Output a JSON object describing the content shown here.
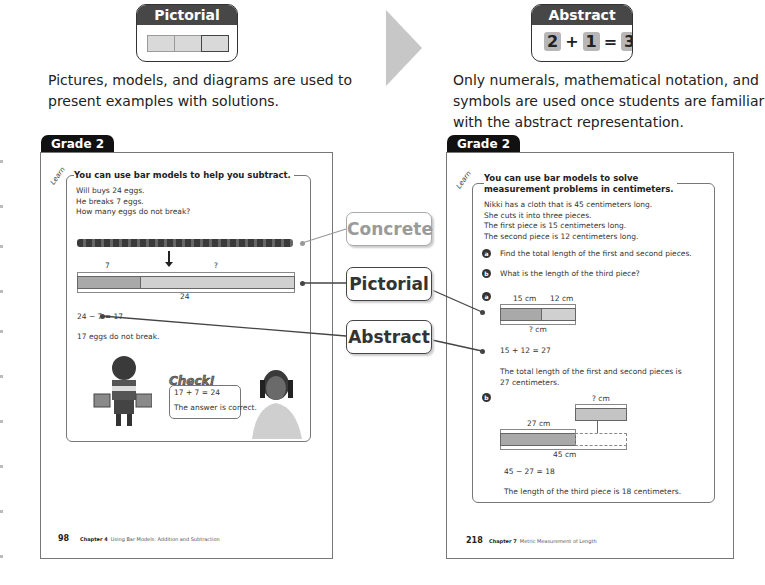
{
  "header": {
    "pictorial": {
      "label": "Pictorial",
      "icon": "bar-model-icon",
      "description_line1": "Pictures, models, and diagrams are used to",
      "description_line2": "present examples with solutions."
    },
    "abstract": {
      "label": "Abstract",
      "equation": [
        "2",
        "+",
        "1",
        "=",
        "3"
      ],
      "description_line1": "Only numerals, mathematical notation, and",
      "description_line2": "symbols are used once students are familiar",
      "description_line3": "with the abstract representation."
    },
    "arrow_icon": "right-arrow-icon"
  },
  "callouts": {
    "concrete": "Concrete",
    "pictorial": "Pictorial",
    "abstract": "Abstract"
  },
  "left_page": {
    "grade": "Grade 2",
    "learn_label": "Learn",
    "title": "You can use bar models to help you subtract.",
    "problem": [
      "Will buys 24 eggs.",
      "He breaks 7 eggs.",
      "How many eggs do not break?"
    ],
    "bar_model": {
      "part_known": "7",
      "part_unknown": "?",
      "whole": "24"
    },
    "equation": "24 − 7 = 17",
    "answer": "17 eggs do not break.",
    "check": {
      "label": "Check!",
      "equation": "17 + 7 = 24",
      "statement": "The answer is correct."
    },
    "footer": {
      "page_number": "98",
      "chapter": "Chapter 4",
      "chapter_title": "Using Bar Models: Addition and Subtraction"
    }
  },
  "right_page": {
    "grade": "Grade 2",
    "learn_label": "Learn",
    "title_line1": "You can use bar models to solve",
    "title_line2": "measurement problems in centimeters.",
    "problem": [
      "Nikki has a cloth that is 45 centimeters long.",
      "She cuts it into three pieces.",
      "The first piece is 15 centimeters long.",
      "The second piece is 12 centimeters long."
    ],
    "question_a": {
      "badge": "a",
      "text": "Find the total length of the first and second pieces."
    },
    "question_b": {
      "badge": "b",
      "text": "What is the length of the third piece?"
    },
    "solution_a": {
      "badge": "a",
      "label_first": "15 cm",
      "label_second": "12 cm",
      "label_total": "? cm",
      "equation": "15 + 12 = 27",
      "answer_line1": "The total length of the first and second pieces is",
      "answer_line2": "27 centimeters."
    },
    "solution_b": {
      "badge": "b",
      "label_unknown": "? cm",
      "label_known": "27 cm",
      "label_total": "45 cm",
      "equation": "45 − 27 = 18",
      "answer": "The length of the third piece is 18 centimeters."
    },
    "footer": {
      "page_number": "218",
      "chapter": "Chapter 7",
      "chapter_title": "Metric Measurement of Length"
    }
  }
}
